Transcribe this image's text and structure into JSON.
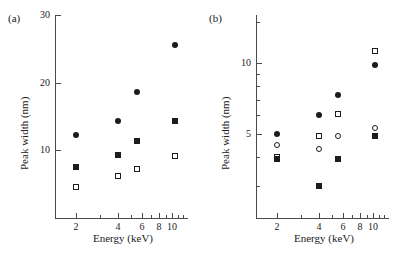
{
  "figure": {
    "panels": [
      {
        "id": "a",
        "label": "(a)",
        "xlabel": "Energy (keV)",
        "ylabel": "Peak width (nm)"
      },
      {
        "id": "b",
        "label": "(b)",
        "xlabel": "Energy (keV)",
        "ylabel": "Peak width (nm)"
      }
    ]
  },
  "chart_data": [
    {
      "type": "scatter",
      "panel": "(a)",
      "title": "",
      "xlabel": "Energy (keV)",
      "ylabel": "Peak width (nm)",
      "xscale": "log",
      "yscale": "linear",
      "xlim": [
        1.4,
        13
      ],
      "ylim": [
        0,
        30
      ],
      "xticks": [
        2,
        4,
        6,
        8,
        10
      ],
      "yticks": [
        10,
        20,
        30
      ],
      "grid": false,
      "legend": "none",
      "x": [
        2,
        4,
        5.5,
        10
      ],
      "series": [
        {
          "name": "filled-circle",
          "marker": "filled-circle",
          "values": [
            12.2,
            14.4,
            18.6,
            14.4
          ]
        },
        {
          "name": "filled-square",
          "marker": "filled-square",
          "values": [
            7.6,
            9.3,
            11.4,
            25.6
          ]
        },
        {
          "name": "open-square",
          "marker": "open-square",
          "values": [
            4.6,
            6.2,
            7.3,
            9.1
          ]
        }
      ],
      "points": [
        {
          "marker": "filled-circle",
          "x": 2,
          "y": 12.2
        },
        {
          "marker": "filled-square",
          "x": 2,
          "y": 7.6
        },
        {
          "marker": "open-square",
          "x": 2,
          "y": 4.6
        },
        {
          "marker": "filled-circle",
          "x": 4,
          "y": 14.4
        },
        {
          "marker": "filled-square",
          "x": 4,
          "y": 9.3
        },
        {
          "marker": "open-square",
          "x": 4,
          "y": 6.2
        },
        {
          "marker": "filled-circle",
          "x": 5.5,
          "y": 18.6
        },
        {
          "marker": "filled-square",
          "x": 5.5,
          "y": 11.4
        },
        {
          "marker": "open-square",
          "x": 5.5,
          "y": 7.3
        },
        {
          "marker": "filled-circle",
          "x": 10.5,
          "y": 25.6
        },
        {
          "marker": "filled-square",
          "x": 10.5,
          "y": 14.4
        },
        {
          "marker": "open-square",
          "x": 10.5,
          "y": 9.1
        }
      ]
    },
    {
      "type": "scatter",
      "panel": "(b)",
      "title": "",
      "xlabel": "Energy (keV)",
      "ylabel": "Peak width (nm)",
      "xscale": "log",
      "yscale": "log",
      "xlim": [
        1.4,
        13
      ],
      "ylim": [
        2.2,
        16
      ],
      "xticks": [
        2,
        4,
        6,
        8,
        10
      ],
      "yticks": [
        5,
        10
      ],
      "grid": false,
      "legend": "none",
      "x": [
        2,
        4,
        5.5,
        10
      ],
      "series": [
        {
          "name": "filled-circle",
          "marker": "filled-circle",
          "values": [
            5.0,
            6.0,
            7.3,
            9.8
          ]
        },
        {
          "name": "open-circle",
          "marker": "open-circle",
          "values": [
            4.5,
            4.3,
            4.9,
            5.3
          ]
        },
        {
          "name": "open-square",
          "marker": "open-square",
          "values": [
            4.0,
            4.9,
            6.1,
            11.2
          ]
        },
        {
          "name": "filled-square",
          "marker": "filled-square",
          "values": [
            3.9,
            3.0,
            3.9,
            4.9
          ]
        }
      ],
      "points": [
        {
          "marker": "filled-circle",
          "x": 2,
          "y": 5.0
        },
        {
          "marker": "open-circle",
          "x": 2,
          "y": 4.5
        },
        {
          "marker": "open-square",
          "x": 2,
          "y": 4.0
        },
        {
          "marker": "filled-square",
          "x": 2,
          "y": 3.9
        },
        {
          "marker": "filled-circle",
          "x": 4,
          "y": 6.0
        },
        {
          "marker": "open-square",
          "x": 4,
          "y": 4.9
        },
        {
          "marker": "open-circle",
          "x": 4,
          "y": 4.3
        },
        {
          "marker": "filled-square",
          "x": 4,
          "y": 3.0
        },
        {
          "marker": "filled-circle",
          "x": 5.5,
          "y": 7.3
        },
        {
          "marker": "open-square",
          "x": 5.5,
          "y": 6.1
        },
        {
          "marker": "open-circle",
          "x": 5.5,
          "y": 4.9
        },
        {
          "marker": "filled-square",
          "x": 5.5,
          "y": 3.9
        },
        {
          "marker": "open-square",
          "x": 10.2,
          "y": 11.2
        },
        {
          "marker": "filled-circle",
          "x": 10.2,
          "y": 9.8
        },
        {
          "marker": "open-circle",
          "x": 10.2,
          "y": 5.3
        },
        {
          "marker": "filled-square",
          "x": 10.2,
          "y": 4.9
        }
      ]
    }
  ]
}
